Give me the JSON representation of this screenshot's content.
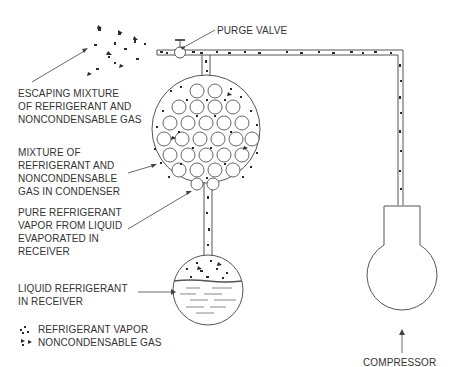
{
  "diagram": {
    "title_components": [
      "Purge valve",
      "Condenser",
      "Receiver",
      "Compressor"
    ],
    "labels": {
      "purge_valve": "PURGE VALVE",
      "escaping": [
        "ESCAPING MIXTURE",
        "OF REFRIGERANT AND",
        "NONCONDENSABLE GAS"
      ],
      "mixture": [
        "MIXTURE OF",
        "REFRIGERANT AND",
        "NONCONDENSABLE",
        "GAS IN CONDENSER"
      ],
      "pure_vapor": [
        "PURE REFRIGERANT",
        "VAPOR FROM LIQUID",
        "EVAPORATED IN",
        "RECEIVER"
      ],
      "liquid": [
        "LIQUID REFRIGERANT",
        "IN RECEIVER"
      ],
      "compressor": "COMPRESSOR"
    },
    "legend": [
      {
        "symbol": "refrigerant-vapor-dots",
        "label": "REFRIGERANT VAPOR"
      },
      {
        "symbol": "noncondensable-gas-arrows",
        "label": "NONCONDENSABLE GAS"
      }
    ],
    "colors": {
      "line": "#555555",
      "particle": "#2a2a2a",
      "background": "#ffffff"
    }
  }
}
